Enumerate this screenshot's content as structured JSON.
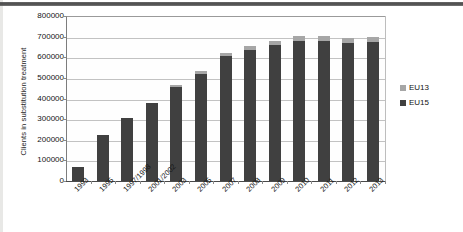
{
  "chart_data": {
    "type": "bar",
    "stacked": true,
    "title": "",
    "xlabel": "",
    "ylabel": "Clients in substitution treatment",
    "ylim": [
      0,
      800000
    ],
    "ytick_step": 100000,
    "ytick_labels": [
      "800000",
      "700000",
      "600000",
      "500000",
      "400000",
      "300000",
      "200000",
      "100000",
      "0"
    ],
    "ytick_values": [
      800000,
      700000,
      600000,
      500000,
      400000,
      300000,
      200000,
      100000,
      0
    ],
    "grid": true,
    "legend_position": "right",
    "categories": [
      "1993",
      "1995",
      "1997/1998",
      "2001/2002",
      "2003",
      "2005",
      "2007",
      "2008",
      "2009",
      "2010",
      "2011",
      "2012",
      "2013"
    ],
    "series": [
      {
        "name": "EU15",
        "color": "#404040",
        "values": [
          68000,
          225000,
          305000,
          380000,
          455000,
          520000,
          605000,
          635000,
          660000,
          680000,
          680000,
          670000,
          675000
        ]
      },
      {
        "name": "EU13",
        "color": "#a6a6a6",
        "values": [
          0,
          0,
          0,
          0,
          10000,
          12000,
          15000,
          18000,
          20000,
          22000,
          22000,
          25000,
          25000
        ]
      }
    ],
    "totals": [
      68000,
      225000,
      305000,
      380000,
      465000,
      532000,
      620000,
      653000,
      680000,
      702000,
      702000,
      695000,
      700000
    ]
  },
  "legend": {
    "items": [
      {
        "label": "EU13",
        "color": "#a6a6a6"
      },
      {
        "label": "EU15",
        "color": "#404040"
      }
    ]
  }
}
